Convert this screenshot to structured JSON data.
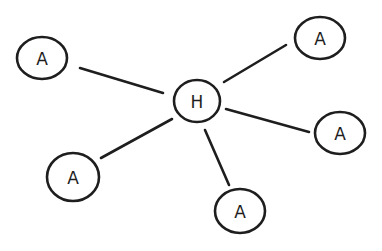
{
  "diagram": {
    "type": "hub-and-spoke",
    "stroke_color": "#1e1e1e",
    "background": "#ffffff",
    "hub": {
      "id": "hub",
      "label": "H",
      "cx": 197,
      "cy": 101,
      "rx": 23,
      "ry": 21
    },
    "nodes": [
      {
        "id": "a1",
        "label": "A",
        "cx": 42,
        "cy": 58,
        "rx": 25,
        "ry": 21
      },
      {
        "id": "a2",
        "label": "A",
        "cx": 320,
        "cy": 38,
        "rx": 25,
        "ry": 21
      },
      {
        "id": "a3",
        "label": "A",
        "cx": 340,
        "cy": 133,
        "rx": 25,
        "ry": 21
      },
      {
        "id": "a4",
        "label": "A",
        "cx": 73,
        "cy": 177,
        "rx": 26,
        "ry": 24
      },
      {
        "id": "a5",
        "label": "A",
        "cx": 240,
        "cy": 211,
        "rx": 25,
        "ry": 22
      }
    ],
    "edges": [
      {
        "from": "hub",
        "to": "a1",
        "x1": 80,
        "y1": 68,
        "x2": 163,
        "y2": 93
      },
      {
        "from": "hub",
        "to": "a2",
        "x1": 224,
        "y1": 82,
        "x2": 286,
        "y2": 45
      },
      {
        "from": "hub",
        "to": "a3",
        "x1": 226,
        "y1": 109,
        "x2": 309,
        "y2": 132
      },
      {
        "from": "hub",
        "to": "a4",
        "x1": 101,
        "y1": 158,
        "x2": 172,
        "y2": 119
      },
      {
        "from": "hub",
        "to": "a5",
        "x1": 205,
        "y1": 130,
        "x2": 229,
        "y2": 185
      }
    ]
  }
}
